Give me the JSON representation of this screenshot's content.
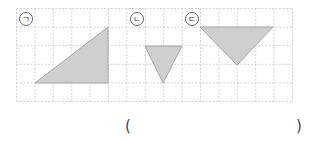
{
  "grid": {
    "x0": 16.5,
    "y0": 8.5,
    "cell_w": 18.4,
    "cell_h": 18.6,
    "cols": 15,
    "rows": 5,
    "line_color": "#c8c8c8",
    "border_color": "#c8c8c8"
  },
  "shape_style": {
    "fill": "#cfcfcf",
    "stroke": "#a8a8a8"
  },
  "triangles": [
    {
      "label": "ㄱ",
      "label_pos": [
        26,
        19
      ],
      "points": [
        [
          35,
          83
        ],
        [
          108,
          27
        ],
        [
          108,
          83
        ]
      ]
    },
    {
      "label": "ㄴ",
      "label_pos": [
        137,
        19
      ],
      "points": [
        [
          145,
          46
        ],
        [
          182,
          46
        ],
        [
          163,
          83
        ]
      ]
    },
    {
      "label": "ㄷ",
      "label_pos": [
        192,
        19
      ],
      "points": [
        [
          200,
          27
        ],
        [
          273,
          27
        ],
        [
          237,
          65
        ]
      ]
    }
  ],
  "answer": {
    "open": "(",
    "close": ")",
    "value": ""
  }
}
